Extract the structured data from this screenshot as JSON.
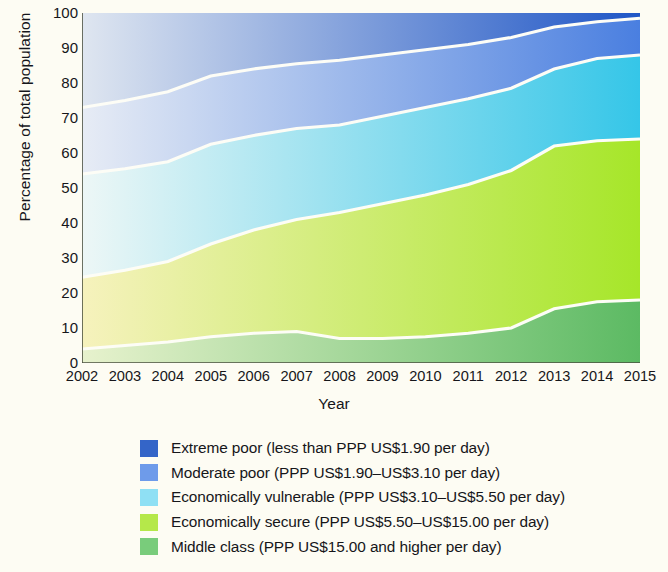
{
  "chart_data": {
    "type": "area",
    "stacked": true,
    "title": "",
    "xlabel": "Year",
    "ylabel": "Percentage of total population",
    "x": [
      2002,
      2003,
      2004,
      2005,
      2006,
      2007,
      2008,
      2009,
      2010,
      2011,
      2012,
      2013,
      2014,
      2015
    ],
    "categories": [
      "2002",
      "2003",
      "2004",
      "2005",
      "2006",
      "2007",
      "2008",
      "2009",
      "2010",
      "2011",
      "2012",
      "2013",
      "2014",
      "2015"
    ],
    "xlim": [
      2002,
      2015
    ],
    "ylim": [
      0,
      100
    ],
    "yticks": [
      0,
      10,
      20,
      30,
      40,
      50,
      60,
      70,
      80,
      90,
      100
    ],
    "grid": false,
    "legend_position": "below",
    "stack_order_bottom_to_top": [
      "Middle class",
      "Economically secure",
      "Economically vulnerable",
      "Moderate poor",
      "Extreme poor"
    ],
    "series": [
      {
        "name": "Extreme poor (less than PPP US$1.90 per day)",
        "short_name": "Extreme poor",
        "color": "#3465c8",
        "values": [
          27.0,
          25.0,
          22.5,
          18.0,
          16.0,
          14.5,
          13.5,
          12.0,
          10.5,
          9.0,
          7.0,
          4.0,
          2.5,
          1.5
        ]
      },
      {
        "name": "Moderate poor (PPP US$1.90–US$3.10 per day)",
        "short_name": "Moderate poor",
        "color": "#6e9bea",
        "values": [
          19.0,
          19.5,
          20.0,
          19.5,
          19.0,
          18.5,
          18.5,
          17.5,
          16.5,
          15.5,
          14.5,
          12.0,
          10.5,
          10.5
        ]
      },
      {
        "name": "Economically vulnerable (PPP US$3.10–US$5.50 per day)",
        "short_name": "Economically vulnerable",
        "color": "#8fe0f4",
        "values": [
          29.5,
          29.0,
          28.5,
          28.5,
          27.0,
          26.0,
          25.0,
          25.0,
          25.0,
          24.5,
          23.5,
          22.0,
          23.5,
          24.0
        ]
      },
      {
        "name": "Economically secure (PPP US$5.50–US$15.00 per day)",
        "short_name": "Economically secure",
        "color": "#b5e84a",
        "values": [
          20.5,
          21.5,
          23.0,
          26.5,
          29.5,
          32.0,
          36.0,
          38.5,
          40.5,
          42.5,
          45.0,
          46.5,
          46.0,
          46.0
        ]
      },
      {
        "name": "Middle class (PPP US$15.00 and higher per day)",
        "short_name": "Middle class",
        "color": "#79cc7b",
        "values": [
          4.0,
          5.0,
          6.0,
          7.5,
          8.5,
          9.0,
          7.0,
          7.0,
          7.5,
          8.5,
          10.0,
          15.5,
          17.5,
          18.0
        ]
      }
    ],
    "cumulative_upper_boundaries": {
      "middle_class_top": [
        4.0,
        5.0,
        6.0,
        7.5,
        8.5,
        9.0,
        7.0,
        7.0,
        7.5,
        8.5,
        10.0,
        15.5,
        17.5,
        18.0
      ],
      "economically_secure_top": [
        24.5,
        26.5,
        29.0,
        34.0,
        38.0,
        41.0,
        43.0,
        45.5,
        48.0,
        51.0,
        55.0,
        62.0,
        63.5,
        64.0
      ],
      "economically_vulnerable_top": [
        54.0,
        55.5,
        57.5,
        62.5,
        65.0,
        67.0,
        68.0,
        70.5,
        73.0,
        75.5,
        78.5,
        84.0,
        87.0,
        88.0
      ],
      "moderate_poor_top": [
        73.0,
        75.0,
        77.5,
        82.0,
        84.0,
        85.5,
        86.5,
        88.0,
        89.5,
        91.0,
        93.0,
        96.0,
        97.5,
        98.5
      ],
      "extreme_poor_top": [
        100,
        100,
        100,
        100,
        100,
        100,
        100,
        100,
        100,
        100,
        100,
        100,
        100,
        100
      ]
    },
    "axis_color": "#4a4f3f",
    "background_color": "#fdfcf3"
  },
  "yaxis": {
    "label": "Percentage of total population",
    "ticks": [
      "100",
      "90",
      "80",
      "70",
      "60",
      "50",
      "40",
      "30",
      "20",
      "10",
      "0"
    ]
  },
  "xaxis": {
    "label": "Year",
    "ticks": [
      "2002",
      "2003",
      "2004",
      "2005",
      "2006",
      "2007",
      "2008",
      "2009",
      "2010",
      "2011",
      "2012",
      "2013",
      "2014",
      "2015"
    ]
  },
  "legend": {
    "items": [
      {
        "label": "Extreme poor (less than PPP US$1.90 per day)",
        "color": "#3465c8",
        "swatch_name": "legend-swatch-extreme-poor"
      },
      {
        "label": "Moderate poor (PPP US$1.90–US$3.10 per day)",
        "color": "#6e9bea",
        "swatch_name": "legend-swatch-moderate-poor"
      },
      {
        "label": "Economically vulnerable (PPP US$3.10–US$5.50 per day)",
        "color": "#8fe0f4",
        "swatch_name": "legend-swatch-economically-vulnerable"
      },
      {
        "label": "Economically secure (PPP US$5.50–US$15.00 per day)",
        "color": "#b5e84a",
        "swatch_name": "legend-swatch-economically-secure"
      },
      {
        "label": "Middle class (PPP US$15.00 and higher per day)",
        "color": "#79cc7b",
        "swatch_name": "legend-swatch-middle-class"
      }
    ]
  }
}
